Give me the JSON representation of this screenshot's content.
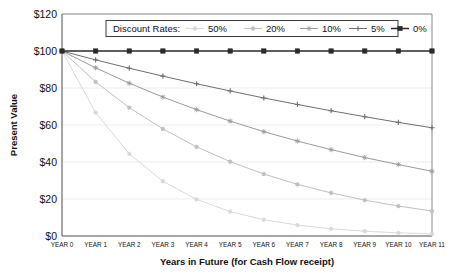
{
  "chart_data": {
    "type": "line",
    "title": "",
    "xlabel": "Years in Future (for Cash Flow receipt)",
    "ylabel": "Present Value",
    "categories": [
      "YEAR 0",
      "YEAR 1",
      "YEAR 2",
      "YEAR 3",
      "YEAR 4",
      "YEAR 5",
      "YEAR 6",
      "YEAR 7",
      "YEAR 8",
      "YEAR 9",
      "YEAR 10",
      "YEAR 11"
    ],
    "x": [
      0,
      1,
      2,
      3,
      4,
      5,
      6,
      7,
      8,
      9,
      10,
      11
    ],
    "ylim": [
      0,
      120
    ],
    "ytick_labels": [
      "$0",
      "$20",
      "$40",
      "$60",
      "$80",
      "$100",
      "$120"
    ],
    "ytick_values": [
      0,
      20,
      40,
      60,
      80,
      100,
      120
    ],
    "grid": true,
    "grid_axis": "y",
    "legend_position": "top-center",
    "legend_title": "Discount Rates:",
    "series": [
      {
        "name": "50%",
        "rate": 0.5,
        "color": "#d9d9d9",
        "marker": "circle",
        "values": [
          100.0,
          66.7,
          44.4,
          29.6,
          19.8,
          13.2,
          8.8,
          5.9,
          3.9,
          2.6,
          1.7,
          1.2
        ]
      },
      {
        "name": "20%",
        "rate": 0.2,
        "color": "#bfbfbf",
        "marker": "circle",
        "values": [
          100.0,
          83.3,
          69.4,
          57.9,
          48.2,
          40.2,
          33.5,
          27.9,
          23.3,
          19.4,
          16.2,
          13.5
        ]
      },
      {
        "name": "10%",
        "rate": 0.1,
        "color": "#9a9a9a",
        "marker": "star",
        "values": [
          100.0,
          90.9,
          82.6,
          75.1,
          68.3,
          62.1,
          56.4,
          51.3,
          46.7,
          42.4,
          38.6,
          35.0
        ]
      },
      {
        "name": "5%",
        "rate": 0.05,
        "color": "#6e6e6e",
        "marker": "plus",
        "values": [
          100.0,
          95.2,
          90.7,
          86.4,
          82.3,
          78.4,
          74.6,
          71.1,
          67.7,
          64.5,
          61.4,
          58.5
        ]
      },
      {
        "name": "0%",
        "rate": 0.0,
        "color": "#2b2b2b",
        "marker": "square",
        "values": [
          100.0,
          100.0,
          100.0,
          100.0,
          100.0,
          100.0,
          100.0,
          100.0,
          100.0,
          100.0,
          100.0,
          100.0
        ]
      }
    ]
  },
  "legend": {
    "title": "Discount Rates:",
    "entries": [
      {
        "label": "50%"
      },
      {
        "label": "20%"
      },
      {
        "label": "10%"
      },
      {
        "label": "5%"
      },
      {
        "label": "0%"
      }
    ]
  },
  "axes": {
    "x_title": "Years in Future (for Cash Flow receipt)",
    "y_title": "Present Value"
  },
  "colors": {
    "axis": "#4d4d4d",
    "grid": "#ededed",
    "text": "#111111",
    "plot_background": "#ffffff"
  }
}
